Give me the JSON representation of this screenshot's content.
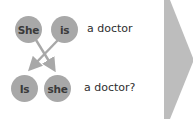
{
  "diagram": {
    "statement": {
      "words": [
        {
          "text": "She"
        },
        {
          "text": "is"
        }
      ],
      "rest": "a doctor"
    },
    "question": {
      "words": [
        {
          "text": "Is"
        },
        {
          "text": "she"
        }
      ],
      "rest": "a doctor?"
    },
    "colors": {
      "bubble": "#a8a8a8",
      "bubble_text": "#3a3a3a",
      "arrow": "#a8a8a8",
      "chevron": "#bdbdbd",
      "text": "#2e2e2e"
    },
    "next_arrow_icon": "chevron-right"
  }
}
